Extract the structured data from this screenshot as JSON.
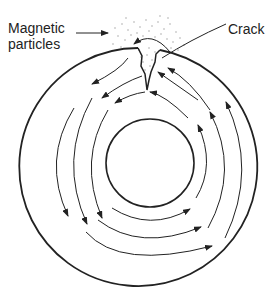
{
  "labels": {
    "magnetic_line1": "Magnetic",
    "magnetic_line2": "particles",
    "crack": "Crack"
  },
  "colors": {
    "line": "#222222",
    "particles": "#999999",
    "background": "#ffffff"
  }
}
